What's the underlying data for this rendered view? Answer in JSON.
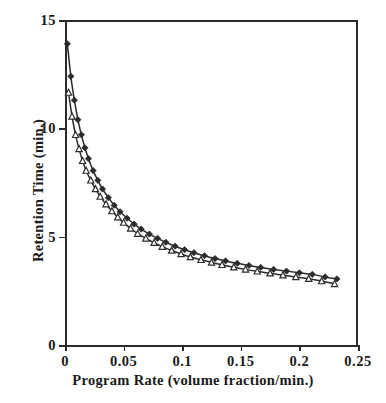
{
  "chart_data": {
    "type": "line",
    "title": "",
    "xlabel": "Program Rate (volume fraction/min.)",
    "ylabel": "Retention Time (min.)",
    "xlim": [
      0,
      0.25
    ],
    "ylim": [
      0,
      15
    ],
    "xticks": [
      0,
      0.05,
      0.1,
      0.15,
      0.2,
      0.25
    ],
    "xtick_labels": [
      "0",
      "0.05",
      "0.1",
      "0.15",
      "0.2",
      "0.25"
    ],
    "yticks": [
      0,
      5,
      10,
      15
    ],
    "ytick_labels": [
      "0",
      "5",
      "10",
      "15"
    ],
    "grid": false,
    "legend": "none",
    "line_color": "#2b2b2b",
    "series": [
      {
        "name": "upper-curve",
        "marker": "filled-diamond",
        "marker_color": "#2b2b2b",
        "x": [
          0.002,
          0.005,
          0.008,
          0.011,
          0.014,
          0.017,
          0.02,
          0.024,
          0.028,
          0.032,
          0.037,
          0.042,
          0.047,
          0.053,
          0.059,
          0.065,
          0.072,
          0.079,
          0.086,
          0.094,
          0.102,
          0.11,
          0.119,
          0.128,
          0.137,
          0.147,
          0.157,
          0.167,
          0.178,
          0.189,
          0.2,
          0.211,
          0.222,
          0.232
        ],
        "y": [
          13.9,
          12.4,
          11.3,
          10.4,
          9.7,
          9.1,
          8.6,
          8.05,
          7.6,
          7.2,
          6.8,
          6.45,
          6.15,
          5.85,
          5.58,
          5.35,
          5.12,
          4.92,
          4.74,
          4.56,
          4.4,
          4.26,
          4.12,
          3.99,
          3.88,
          3.77,
          3.67,
          3.58,
          3.49,
          3.41,
          3.33,
          3.26,
          3.14,
          3.05
        ]
      },
      {
        "name": "lower-curve",
        "marker": "open-triangle",
        "marker_color": "#2b2b2b",
        "x": [
          0.003,
          0.006,
          0.009,
          0.012,
          0.015,
          0.018,
          0.022,
          0.026,
          0.03,
          0.035,
          0.04,
          0.045,
          0.05,
          0.056,
          0.062,
          0.069,
          0.076,
          0.083,
          0.091,
          0.099,
          0.107,
          0.116,
          0.125,
          0.134,
          0.144,
          0.154,
          0.164,
          0.175,
          0.186,
          0.197,
          0.208,
          0.219,
          0.23
        ],
        "y": [
          11.65,
          10.55,
          9.7,
          9.05,
          8.5,
          8.05,
          7.6,
          7.2,
          6.85,
          6.5,
          6.18,
          5.9,
          5.65,
          5.38,
          5.14,
          4.92,
          4.72,
          4.54,
          4.36,
          4.2,
          4.06,
          3.93,
          3.81,
          3.7,
          3.59,
          3.49,
          3.4,
          3.31,
          3.22,
          3.14,
          3.06,
          2.95,
          2.82
        ]
      }
    ]
  }
}
